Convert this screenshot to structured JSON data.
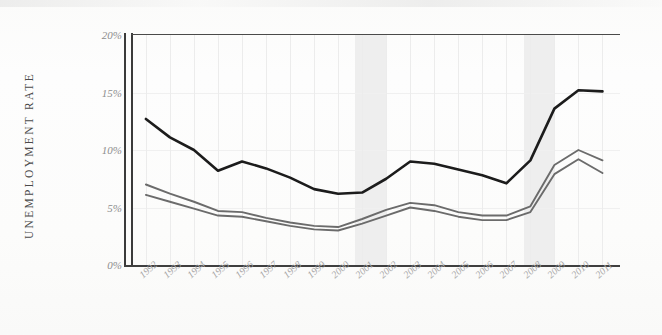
{
  "chart_data": {
    "type": "line",
    "title": "",
    "xlabel": "",
    "ylabel": "UNEMPLOYMENT RATE",
    "ylim": [
      0,
      20
    ],
    "yticks": [
      "0%",
      "5%",
      "10%",
      "15%",
      "20%"
    ],
    "ytick_values": [
      0,
      5,
      10,
      15,
      20
    ],
    "grid": true,
    "legend": "none",
    "categories": [
      "1992",
      "1993",
      "1994",
      "1995",
      "1996",
      "1997",
      "1998",
      "1999",
      "2000",
      "2001",
      "2002",
      "2003",
      "2004",
      "2005",
      "2006",
      "2007",
      "2008",
      "2009",
      "2010",
      "2011"
    ],
    "series": [
      {
        "name": "top-line",
        "color": "#1c1c1c",
        "values": [
          12.7,
          11.1,
          10.0,
          8.2,
          9.0,
          8.4,
          7.6,
          6.6,
          6.2,
          6.3,
          7.5,
          9.0,
          8.8,
          8.3,
          7.8,
          7.1,
          9.1,
          13.6,
          15.2,
          15.1
        ]
      },
      {
        "name": "middle-line",
        "color": "#6b6b6b",
        "values": [
          7.0,
          6.2,
          5.5,
          4.7,
          4.6,
          4.1,
          3.7,
          3.4,
          3.3,
          4.0,
          4.8,
          5.4,
          5.2,
          4.6,
          4.3,
          4.3,
          5.1,
          8.7,
          10.0,
          9.1
        ]
      },
      {
        "name": "bottom-line",
        "color": "#6b6b6b",
        "values": [
          6.1,
          5.5,
          4.9,
          4.3,
          4.2,
          3.8,
          3.4,
          3.1,
          3.0,
          3.6,
          4.3,
          5.0,
          4.7,
          4.2,
          3.9,
          3.9,
          4.6,
          7.9,
          9.2,
          8.0
        ]
      }
    ],
    "shaded_bands": [
      {
        "name": "recession-2001",
        "start": "2001",
        "end": "2002"
      },
      {
        "name": "recession-2008",
        "start": "2008",
        "end": "2009"
      }
    ]
  }
}
